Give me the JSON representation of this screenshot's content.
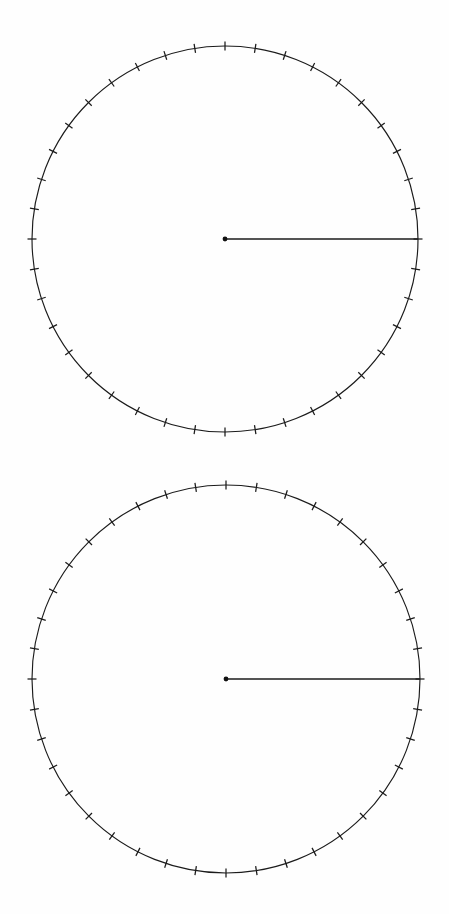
{
  "page": {
    "background_color": "#fefefe",
    "ink_color": "#1b1b1b",
    "width": 449,
    "height": 914
  },
  "figures": [
    {
      "name": "circle-diagram-top",
      "label": "Top circle",
      "center_x": 225,
      "center_y": 239,
      "radius": 193,
      "tick_count": 40,
      "tick_spacing_degrees": 9,
      "tick_length": 9,
      "center_dot_radius": 2.4,
      "rays": [
        {
          "name": "ray-initial-side",
          "angle_degrees": 0,
          "length_fraction": 1.0
        }
      ],
      "angle_degrees": 0
    },
    {
      "name": "circle-diagram-bottom",
      "label": "Bottom circle",
      "center_x": 226,
      "center_y": 679,
      "radius": 194,
      "tick_count": 40,
      "tick_spacing_degrees": 9,
      "tick_length": 9,
      "center_dot_radius": 2.4,
      "rays": [
        {
          "name": "ray-initial-side",
          "angle_degrees": 0,
          "length_fraction": 1.0
        }
      ],
      "angle_degrees": 0
    }
  ],
  "chart_data": {
    "type": "scatter",
    "xlabel": "",
    "ylabel": "",
    "series": [
      {
        "name": "circle-diagram-top",
        "center": [
          225,
          239
        ],
        "radius": 193,
        "tick_angles_degrees": [
          0,
          9,
          18,
          27,
          36,
          45,
          54,
          63,
          72,
          81,
          90,
          99,
          108,
          117,
          126,
          135,
          144,
          153,
          162,
          171,
          180,
          189,
          198,
          207,
          216,
          225,
          234,
          243,
          252,
          261,
          270,
          279,
          288,
          297,
          306,
          315,
          324,
          333,
          342,
          351
        ],
        "ray_angles_degrees": [
          0
        ]
      },
      {
        "name": "circle-diagram-bottom",
        "center": [
          226,
          679
        ],
        "radius": 194,
        "tick_angles_degrees": [
          0,
          9,
          18,
          27,
          36,
          45,
          54,
          63,
          72,
          81,
          90,
          99,
          108,
          117,
          126,
          135,
          144,
          153,
          162,
          171,
          180,
          189,
          198,
          207,
          216,
          225,
          234,
          243,
          252,
          261,
          270,
          279,
          288,
          297,
          306,
          315,
          324,
          333,
          342,
          351
        ],
        "ray_angles_degrees": [
          0
        ]
      }
    ],
    "legend": [],
    "grid": false
  }
}
